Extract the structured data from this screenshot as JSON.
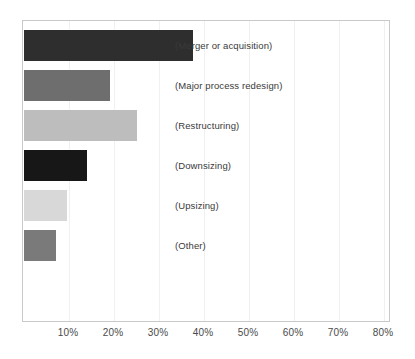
{
  "chart_data": {
    "type": "bar",
    "orientation": "horizontal",
    "title": "",
    "subtitle": "",
    "xlabel": "",
    "ylabel": "",
    "xlim": [
      0,
      100
    ],
    "grid": true,
    "legend": "none",
    "categories": [
      "(Merger or acquisition)",
      "(Major process redesign)",
      "(Restructuring)",
      "(Downsizing)",
      "(Upsizing)",
      "(Other)"
    ],
    "values": [
      37.5,
      19,
      25,
      14,
      9.5,
      7
    ],
    "value_unit": "%",
    "bar_colors": [
      "#2e2e2e",
      "#6e6e6e",
      "#bdbdbd",
      "#171717",
      "#d8d8d8",
      "#7a7a7a"
    ],
    "xticks": [
      10,
      20,
      30,
      40,
      50,
      60,
      70,
      80,
      90
    ],
    "xticklabels": [
      "10%",
      "20%",
      "30%",
      "40%",
      "50%",
      "60%",
      "70%",
      "80%",
      "90%"
    ],
    "axis_color": "#c9c9c9",
    "gridline_color": "#f0f0f0",
    "background_color": "#ffffff",
    "label_text_color": "#3a3a3a"
  }
}
